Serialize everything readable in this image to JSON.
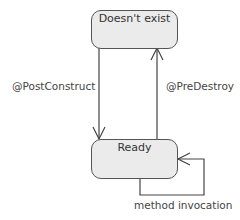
{
  "diagram": {
    "type": "state-machine",
    "states": [
      {
        "id": "doesnt_exist",
        "label": "Doesn't exist"
      },
      {
        "id": "ready",
        "label": "Ready"
      }
    ],
    "transitions": [
      {
        "from": "doesnt_exist",
        "to": "ready",
        "label": "@PostConstruct"
      },
      {
        "from": "ready",
        "to": "doesnt_exist",
        "label": "@PreDestroy"
      },
      {
        "from": "ready",
        "to": "ready",
        "label": "method invocation"
      }
    ],
    "colors": {
      "state_fill": "#ebebeb",
      "stroke": "#555555",
      "text": "#333333"
    }
  }
}
